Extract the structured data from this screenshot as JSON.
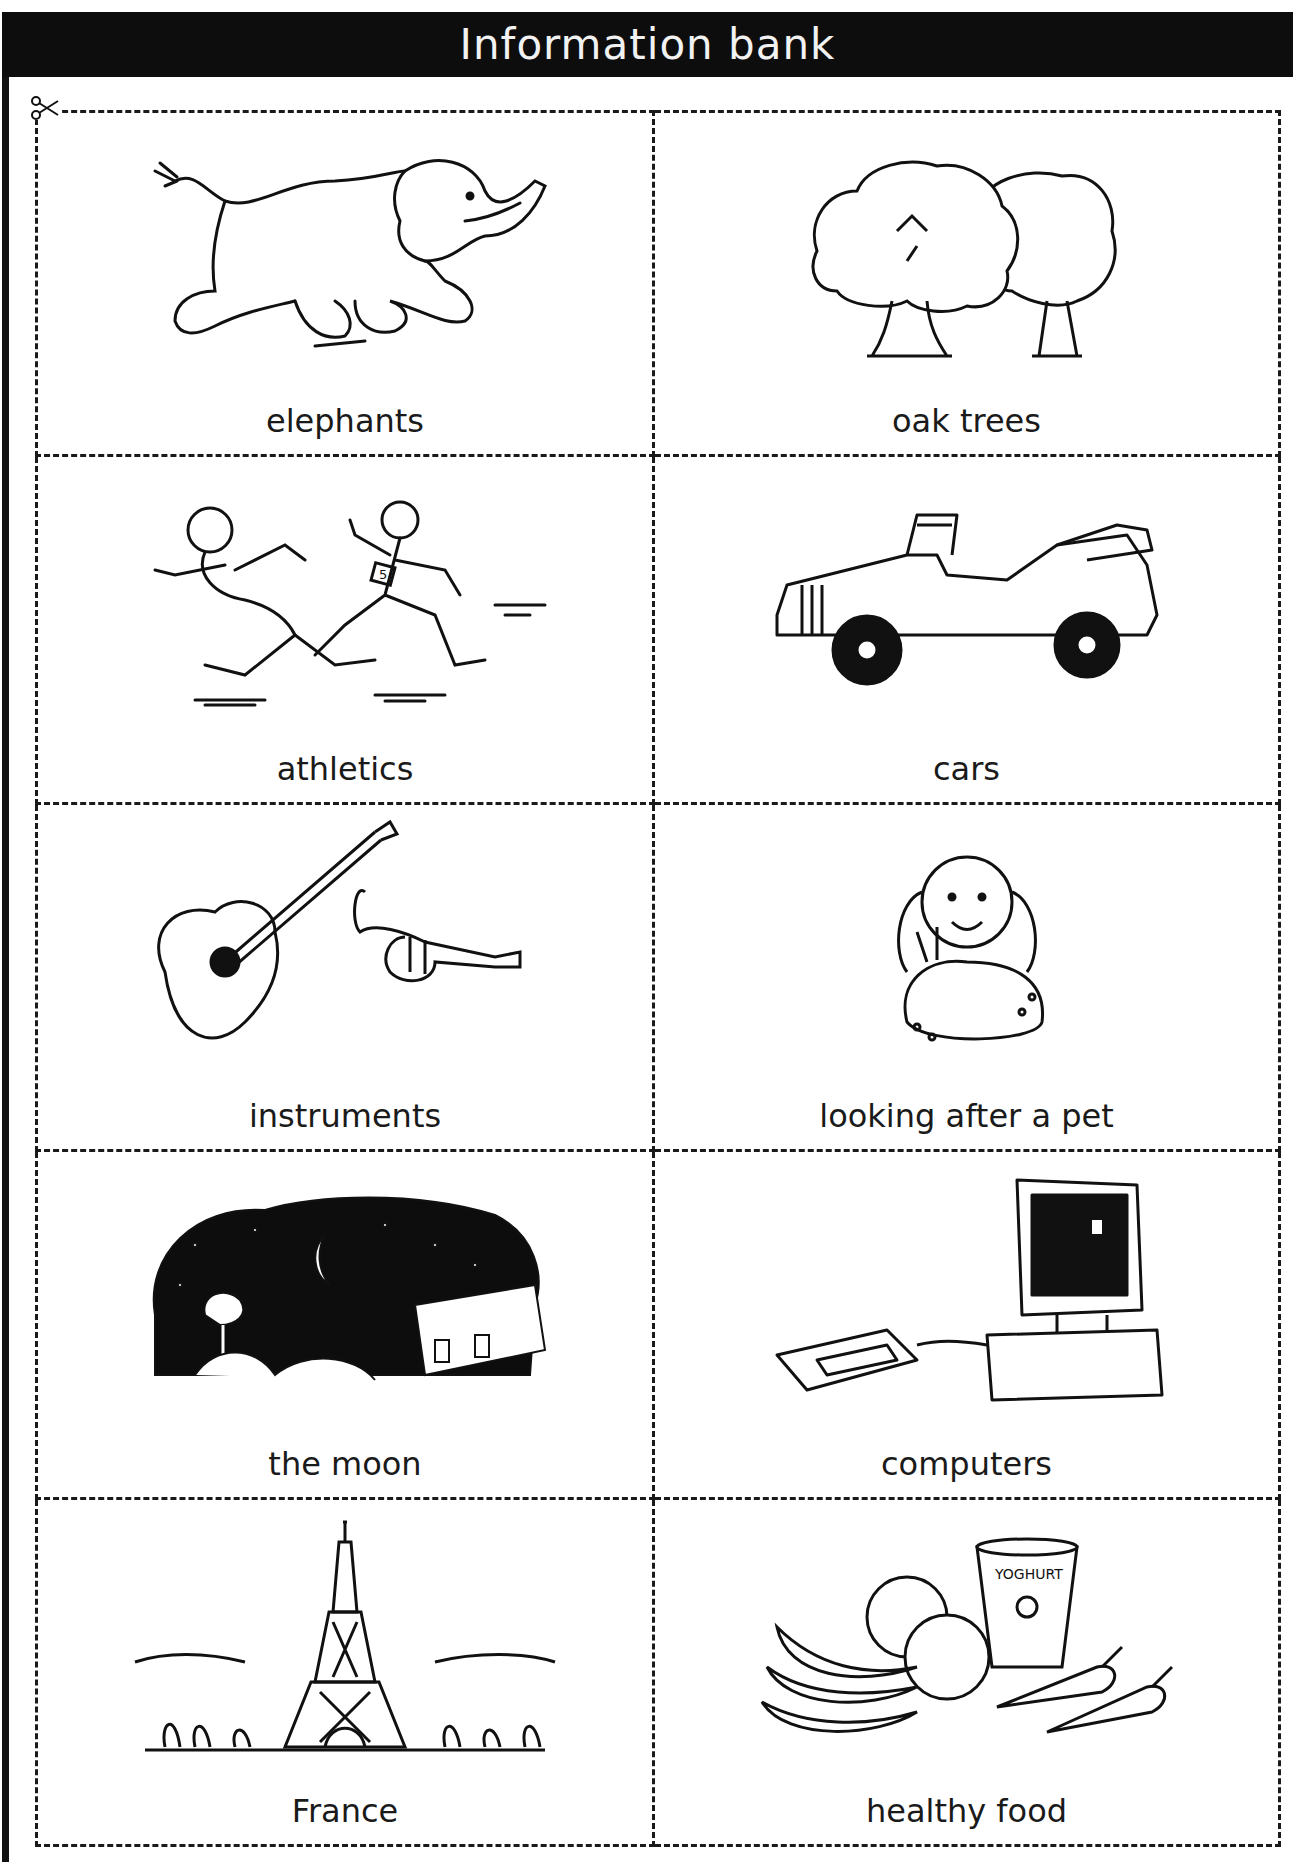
{
  "title": "Information bank",
  "cards": [
    {
      "label": "elephants",
      "icon": "elephant-icon"
    },
    {
      "label": "oak trees",
      "icon": "oak-trees-icon"
    },
    {
      "label": "athletics",
      "icon": "runners-icon"
    },
    {
      "label": "cars",
      "icon": "vintage-car-icon"
    },
    {
      "label": "instruments",
      "icon": "guitar-trumpet-icon"
    },
    {
      "label": "looking after a pet",
      "icon": "girl-with-rabbit-icon"
    },
    {
      "label": "the moon",
      "icon": "night-sky-moon-icon"
    },
    {
      "label": "computers",
      "icon": "computer-icon"
    },
    {
      "label": "France",
      "icon": "eiffel-tower-icon"
    },
    {
      "label": "healthy food",
      "icon": "fruit-yoghurt-carrots-icon"
    }
  ],
  "illustration_text": {
    "runner_bib": "5",
    "yoghurt_cup": "YOGHURT"
  },
  "cut_marker": "scissors-icon"
}
